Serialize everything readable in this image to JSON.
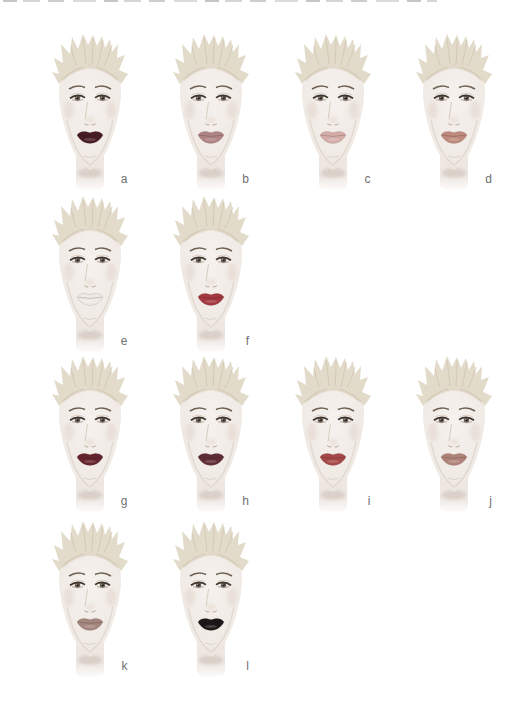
{
  "figure": {
    "items": [
      {
        "label": "a",
        "lip_color": "#441820"
      },
      {
        "label": "b",
        "lip_color": "#b08484"
      },
      {
        "label": "c",
        "lip_color": "#d7aeaa"
      },
      {
        "label": "d",
        "lip_color": "#bf8a7c"
      },
      {
        "label": "e",
        "lip_color": "#f2edea"
      },
      {
        "label": "f",
        "lip_color": "#a3343c"
      },
      {
        "label": "g",
        "lip_color": "#63202a"
      },
      {
        "label": "h",
        "lip_color": "#5e2a32"
      },
      {
        "label": "i",
        "lip_color": "#a64546"
      },
      {
        "label": "j",
        "lip_color": "#b08379"
      },
      {
        "label": "k",
        "lip_color": "#a4877e"
      },
      {
        "label": "l",
        "lip_color": "#191214"
      }
    ],
    "rows": [
      [
        "a",
        "b",
        "c",
        "d"
      ],
      [
        "e",
        "f"
      ],
      [
        "g",
        "h",
        "i",
        "j"
      ],
      [
        "k",
        "l"
      ]
    ],
    "style_colors": {
      "hair": "#e5decd",
      "skin": "#f6f1ee",
      "label_text": "#6f6f6f"
    }
  },
  "top_edge": {
    "artifact": "cropped remnants of a text line cut off at the top of the screenshot"
  }
}
